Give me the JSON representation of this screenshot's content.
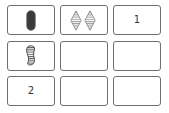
{
  "board": {
    "rows": 3,
    "cols": 3,
    "cards": [
      {
        "index": 0,
        "type": "shape",
        "shape": "oval",
        "count": 1,
        "fill": "solid",
        "color": "#3a3a3a"
      },
      {
        "index": 1,
        "type": "shape",
        "shape": "diamond",
        "count": 2,
        "fill": "striped",
        "color": "#8a8a8a"
      },
      {
        "index": 2,
        "type": "number",
        "label": "1"
      },
      {
        "index": 3,
        "type": "shape",
        "shape": "squiggle",
        "count": 1,
        "fill": "striped",
        "color": "#3a3a3a"
      },
      {
        "index": 4,
        "type": "empty"
      },
      {
        "index": 5,
        "type": "empty"
      },
      {
        "index": 6,
        "type": "number",
        "label": "2"
      },
      {
        "index": 7,
        "type": "empty"
      },
      {
        "index": 8,
        "type": "empty"
      }
    ]
  },
  "colors": {
    "card_border": "#6f6f6f",
    "background": "#ffffff",
    "text": "#333333"
  }
}
